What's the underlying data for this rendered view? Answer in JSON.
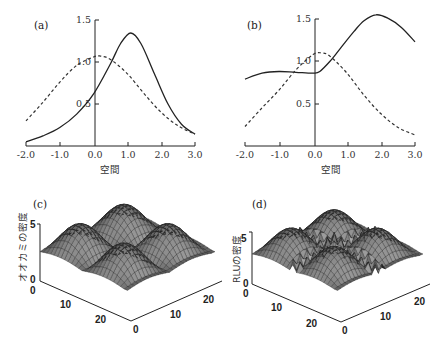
{
  "chart_data": [
    {
      "panel": "(a)",
      "type": "line",
      "xlabel": "空間",
      "ylabel": "",
      "xlim": [
        -2.0,
        3.0
      ],
      "ylim": [
        0,
        1.5
      ],
      "xticks": [
        "-2.0",
        "-1.0",
        "0.0",
        "1.0",
        "2.0",
        "3.0"
      ],
      "yticks": [
        "0.5",
        "1.0",
        "1.5"
      ],
      "grid": false,
      "series": [
        {
          "name": "solid",
          "style": "solid",
          "x": [
            -2.0,
            -1.5,
            -1.0,
            -0.5,
            0.0,
            0.5,
            0.8,
            1.1,
            1.4,
            1.8,
            2.2,
            2.6,
            3.0
          ],
          "y": [
            0.05,
            0.12,
            0.22,
            0.38,
            0.62,
            0.98,
            1.22,
            1.345,
            1.22,
            0.86,
            0.5,
            0.26,
            0.14
          ]
        },
        {
          "name": "dashed",
          "style": "dashed",
          "x": [
            -2.0,
            -1.5,
            -1.0,
            -0.5,
            0.0,
            0.2,
            0.5,
            1.0,
            1.5,
            2.0,
            2.5,
            3.0
          ],
          "y": [
            0.3,
            0.52,
            0.76,
            0.96,
            1.06,
            1.07,
            1.03,
            0.86,
            0.62,
            0.4,
            0.24,
            0.14
          ]
        }
      ]
    },
    {
      "panel": "(b)",
      "type": "line",
      "xlabel": "空間",
      "ylabel": "",
      "xlim": [
        -2.0,
        3.0
      ],
      "ylim": [
        0,
        1.5
      ],
      "xticks": [
        "-2.0",
        "-1.0",
        "0.0",
        "1.0",
        "2.0",
        "3.0"
      ],
      "yticks": [
        "0.5",
        "1.0",
        "1.5"
      ],
      "grid": false,
      "series": [
        {
          "name": "solid",
          "style": "solid",
          "x": [
            -2.0,
            -1.5,
            -1.0,
            -0.5,
            0.0,
            0.2,
            0.5,
            0.8,
            1.2,
            1.5,
            1.85,
            2.2,
            2.6,
            3.0
          ],
          "y": [
            0.79,
            0.86,
            0.88,
            0.87,
            0.86,
            0.88,
            1.0,
            1.15,
            1.35,
            1.48,
            1.55,
            1.51,
            1.4,
            1.23
          ]
        },
        {
          "name": "dashed",
          "style": "dashed",
          "x": [
            -2.0,
            -1.5,
            -1.0,
            -0.5,
            0.0,
            0.25,
            0.5,
            1.0,
            1.5,
            2.0,
            2.5,
            3.0
          ],
          "y": [
            0.23,
            0.45,
            0.66,
            0.9,
            1.08,
            1.1,
            1.06,
            0.86,
            0.6,
            0.38,
            0.22,
            0.13
          ]
        }
      ]
    },
    {
      "panel": "(c)",
      "type": "surface",
      "zlabel": "オオカミの密度",
      "zticks": [
        "0",
        "5"
      ],
      "xticks": [
        "0",
        "10",
        "20"
      ],
      "yticks": [
        "0",
        "10",
        "20"
      ],
      "zlim": [
        0,
        5
      ],
      "description": "2x2 array of smooth dome-shaped peaks over a 0-25 grid"
    },
    {
      "panel": "(d)",
      "type": "surface",
      "zlabel": "RLUの密度",
      "zticks": [
        "0",
        "5"
      ],
      "xticks": [
        "0",
        "10",
        "20"
      ],
      "yticks": [
        "0",
        "10",
        "20"
      ],
      "zlim": [
        0,
        5
      ],
      "description": "domes similar to (c) with a sharp spike and jagged ridges near the center"
    }
  ],
  "panels": {
    "a": {
      "label": "(a)",
      "xlabel": "空間",
      "xticks": [
        "-2.0",
        "-1.0",
        "0.0",
        "1.0",
        "2.0",
        "3.0"
      ],
      "yticks": [
        "0.5",
        "1.0",
        "1.5"
      ]
    },
    "b": {
      "label": "(b)",
      "xlabel": "空間",
      "xticks": [
        "-2.0",
        "-1.0",
        "0.0",
        "1.0",
        "2.0",
        "3.0"
      ],
      "yticks": [
        "0.5",
        "1.0",
        "1.5"
      ]
    },
    "c": {
      "label": "(c)",
      "zlabel": "オオカミの密度",
      "zticks": [
        "0",
        "5"
      ],
      "left_ticks": [
        "0",
        "10",
        "20"
      ],
      "right_ticks": [
        "0",
        "10",
        "20"
      ]
    },
    "d": {
      "label": "(d)",
      "zlabel": "RLUの密度",
      "zticks": [
        "0",
        "5"
      ],
      "left_ticks": [
        "0",
        "10",
        "20"
      ],
      "right_ticks": [
        "0",
        "10",
        "20"
      ]
    }
  }
}
